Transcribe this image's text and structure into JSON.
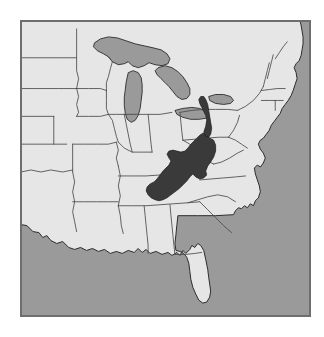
{
  "figure": {
    "type": "thematic-map",
    "title": "",
    "caption": "",
    "region_depicted": "Eastern and central United States",
    "projection_note": "simple outline map, no graticule, no labels"
  },
  "map": {
    "name": "united-states-appalachia-highlight-map",
    "width_px": 291,
    "height_px": 297,
    "offset_x_px": 20,
    "offset_y_px": 20,
    "has_labels": false,
    "has_legend": false,
    "has_scalebar": false,
    "has_north_arrow": false,
    "has_graticule": false
  },
  "colors": {
    "page_background": "#ffffff",
    "land": "#e6e6e6",
    "water": "#9a9a9a",
    "great_lakes": "#9a9a9a",
    "highlight": "#3a3a3a",
    "border_line": "#4a4a4a",
    "coastline": "#2b2b2b",
    "panel_frame": "#6e6e6e"
  },
  "layers": [
    {
      "name": "ocean-and-lakes",
      "fill": "#9a9a9a",
      "label": "Water bodies"
    },
    {
      "name": "land-states",
      "fill": "#e6e6e6",
      "label": "United States land area"
    },
    {
      "name": "state-boundaries",
      "stroke": "#4a4a4a",
      "label": "State boundaries"
    },
    {
      "name": "highlight-region",
      "fill": "#3a3a3a",
      "label": "Highlighted region"
    }
  ],
  "highlight": {
    "name": "appalachian-region",
    "label": "Appalachian highland band",
    "fill": "#3a3a3a",
    "description": "A narrow diagonal band running southwest to northeast through the southern and central Appalachian Mountains",
    "states_covered": [
      "West Virginia",
      "Virginia",
      "Kentucky",
      "Tennessee",
      "North Carolina",
      "Georgia",
      "Alabama"
    ]
  },
  "water_bodies": [
    {
      "name": "atlantic-ocean",
      "label": "Atlantic Ocean"
    },
    {
      "name": "gulf-of-mexico",
      "label": "Gulf of Mexico"
    },
    {
      "name": "lake-superior",
      "label": "Lake Superior"
    },
    {
      "name": "lake-michigan",
      "label": "Lake Michigan"
    },
    {
      "name": "lake-huron",
      "label": "Lake Huron"
    },
    {
      "name": "lake-erie",
      "label": "Lake Erie"
    },
    {
      "name": "lake-ontario",
      "label": "Lake Ontario"
    }
  ]
}
